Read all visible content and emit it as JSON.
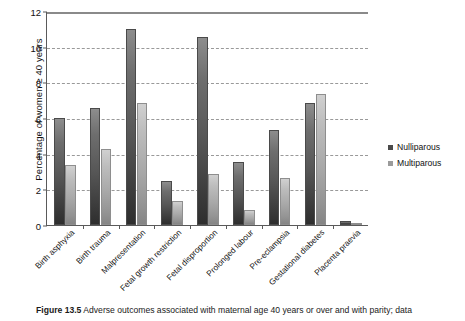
{
  "chart_data": {
    "type": "bar",
    "title": "",
    "xlabel": "",
    "ylabel": "Percentage of women ≥ 40 years",
    "ylim": [
      0,
      12
    ],
    "yticks": [
      0,
      2,
      4,
      6,
      8,
      10,
      12
    ],
    "grid": true,
    "legend_position": "right",
    "categories": [
      "Birth asphyxia",
      "Birth trauma",
      "Malpresentation",
      "Fetal growth restriction",
      "Fetal disproportion",
      "Prolonged labour",
      "Pre-eclampsia",
      "Gestational diabetes",
      "Placenta praevia"
    ],
    "series": [
      {
        "name": "Nulliparous",
        "color": "#4a4a4a",
        "values": [
          6.0,
          6.55,
          11.0,
          2.45,
          10.55,
          3.55,
          5.35,
          6.85,
          0.2
        ]
      },
      {
        "name": "Multiparous",
        "color": "#9b9b9b",
        "values": [
          3.35,
          4.25,
          6.85,
          1.35,
          2.85,
          0.85,
          2.65,
          7.35,
          0.1
        ]
      }
    ]
  },
  "caption": {
    "label": "Figure 13.5",
    "text": "Adverse outcomes associated with maternal age 40 years or over and with parity; data"
  }
}
